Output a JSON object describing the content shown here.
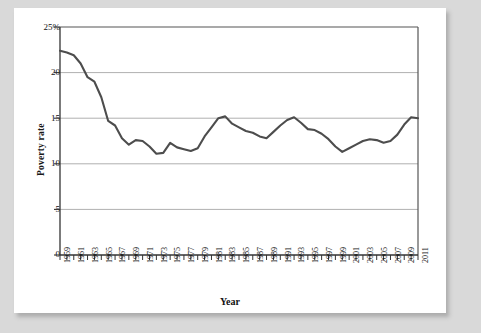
{
  "figure": {
    "background_color": "#ffffff",
    "page_background_color": "#d9d9d9"
  },
  "chart_data": {
    "type": "line",
    "title": "",
    "xlabel": "Year",
    "ylabel": "Poverty rate",
    "xlim": [
      1959,
      2011
    ],
    "ylim": [
      0,
      25
    ],
    "grid": true,
    "grid_axis": "y",
    "legend": false,
    "line_color": "#4d4d4d",
    "grid_color": "#b3b3b3",
    "axis_color": "#333333",
    "y_ticks": [
      0,
      5,
      10,
      15,
      20,
      25
    ],
    "y_tick_labels": [
      "0",
      "5",
      "10",
      "15",
      "20",
      "25%"
    ],
    "x_tick_labels": [
      "1959",
      "1961",
      "1963",
      "1965",
      "1967",
      "1969",
      "1971",
      "1973",
      "1975",
      "1977",
      "1979",
      "1981",
      "1983",
      "1985",
      "1987",
      "1989",
      "1991",
      "1993",
      "1995",
      "1997",
      "1999",
      "2001",
      "2003",
      "2005",
      "2007",
      "2009",
      "2011"
    ],
    "x": [
      1959,
      1960,
      1961,
      1962,
      1963,
      1964,
      1965,
      1966,
      1967,
      1968,
      1969,
      1970,
      1971,
      1972,
      1973,
      1974,
      1975,
      1976,
      1977,
      1978,
      1979,
      1980,
      1981,
      1982,
      1983,
      1984,
      1985,
      1986,
      1987,
      1988,
      1989,
      1990,
      1991,
      1992,
      1993,
      1994,
      1995,
      1996,
      1997,
      1998,
      1999,
      2000,
      2001,
      2002,
      2003,
      2004,
      2005,
      2006,
      2007,
      2008,
      2009,
      2010,
      2011
    ],
    "values": [
      22.4,
      22.2,
      21.9,
      21.0,
      19.5,
      19.0,
      17.3,
      14.7,
      14.2,
      12.8,
      12.1,
      12.6,
      12.5,
      11.9,
      11.1,
      11.2,
      12.3,
      11.8,
      11.6,
      11.4,
      11.7,
      13.0,
      14.0,
      15.0,
      15.2,
      14.4,
      14.0,
      13.6,
      13.4,
      13.0,
      12.8,
      13.5,
      14.2,
      14.8,
      15.1,
      14.5,
      13.8,
      13.7,
      13.3,
      12.7,
      11.9,
      11.3,
      11.7,
      12.1,
      12.5,
      12.7,
      12.6,
      12.3,
      12.5,
      13.2,
      14.3,
      15.1,
      15.0
    ],
    "series_name": "Poverty rate",
    "units": "percent"
  },
  "axis_labels": {
    "y_axis_title": "Poverty rate",
    "x_axis_title": "Year"
  }
}
